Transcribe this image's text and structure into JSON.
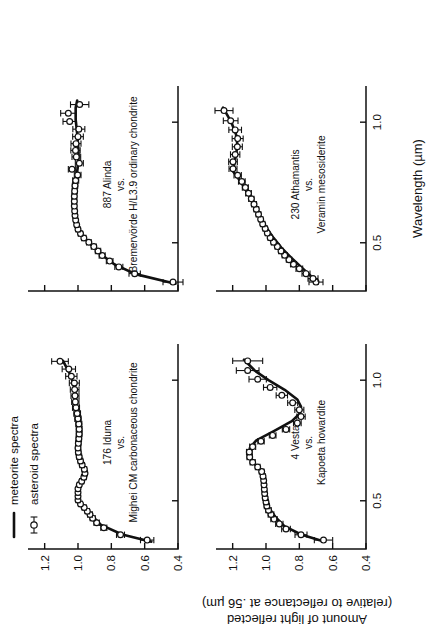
{
  "figure": {
    "axis_titles": {
      "x": "Wavelength (µm)",
      "y_line1": "Amount of light reflected",
      "y_line2": "(relative to reflectance at .56 µm)"
    },
    "legend": {
      "meteorite": "meteorite spectra",
      "asteroid": "asteroid spectra",
      "meteorite_symbol": "solid-line",
      "asteroid_symbol": "open-circle-errorbar"
    },
    "ink_color": "#111111",
    "marker_fill": "#ffffff"
  },
  "chart_data": {
    "type": "scatter",
    "title": "",
    "xlabel": "Wavelength (µm)",
    "ylabel": "Amount of light reflected (relative to reflectance at .56 µm)",
    "xlim": [
      0.3,
      1.15
    ],
    "ylim": [
      0.4,
      1.3
    ],
    "xticks": [
      0.5,
      1.0
    ],
    "xticklabels": [
      "0.5",
      "1.0"
    ],
    "yticks": [
      0.4,
      0.6,
      0.8,
      1.0,
      1.2
    ],
    "yticklabels": [
      "0.4",
      "0.6",
      "0.8",
      "1.0",
      "1.2"
    ],
    "grid": false,
    "legend_position": "top-left",
    "panels": [
      {
        "id": "iduna",
        "position": "top-left",
        "caption_lines": [
          "176 Iduna",
          "vs.",
          "Mighei CM carbonaceous chondrite"
        ],
        "asteroid_series": {
          "name": "asteroid spectra",
          "x": [
            0.337,
            0.359,
            0.388,
            0.409,
            0.428,
            0.443,
            0.457,
            0.472,
            0.487,
            0.503,
            0.519,
            0.534,
            0.55,
            0.566,
            0.581,
            0.598,
            0.614,
            0.631,
            0.648,
            0.665,
            0.683,
            0.701,
            0.719,
            0.738,
            0.757,
            0.777,
            0.797,
            0.818,
            0.84,
            0.862,
            0.886,
            0.91,
            0.935,
            0.961,
            0.988,
            1.016,
            1.046,
            1.078
          ],
          "y": [
            0.585,
            0.745,
            0.845,
            0.888,
            0.912,
            0.928,
            0.944,
            0.963,
            0.985,
            1.0,
            1.0,
            1.0,
            1.0,
            0.992,
            0.978,
            0.965,
            0.958,
            0.962,
            0.975,
            0.985,
            0.993,
            0.998,
            1.0,
            0.998,
            0.995,
            0.993,
            0.993,
            0.995,
            1.0,
            1.005,
            1.012,
            1.016,
            1.018,
            1.02,
            1.022,
            1.04,
            1.055,
            1.108
          ],
          "yerr": [
            0.04,
            0.024,
            0.018,
            0.016,
            0.015,
            0.014,
            0.013,
            0.012,
            0.012,
            0.012,
            0.012,
            0.012,
            0.01,
            0.012,
            0.012,
            0.014,
            0.014,
            0.014,
            0.014,
            0.014,
            0.015,
            0.015,
            0.015,
            0.016,
            0.016,
            0.017,
            0.017,
            0.018,
            0.019,
            0.02,
            0.021,
            0.022,
            0.024,
            0.026,
            0.03,
            0.034,
            0.04,
            0.05
          ]
        },
        "meteorite_series": {
          "name": "meteorite spectra",
          "x": [
            0.33,
            0.36,
            0.4,
            0.44,
            0.48,
            0.51,
            0.54,
            0.57,
            0.6,
            0.63,
            0.66,
            0.7,
            0.74,
            0.79,
            0.84,
            0.9,
            0.96,
            1.02,
            1.08
          ],
          "y": [
            0.56,
            0.735,
            0.862,
            0.92,
            0.975,
            1.0,
            1.002,
            0.99,
            0.968,
            0.96,
            0.975,
            0.992,
            0.998,
            0.993,
            0.998,
            1.008,
            1.018,
            1.044,
            1.09
          ]
        }
      },
      {
        "id": "alinda",
        "position": "top-right",
        "caption_lines": [
          "887 Alinda",
          "vs.",
          "Bremervörde H/L3.9 ordinary chondrite"
        ],
        "asteroid_series": {
          "name": "asteroid spectra",
          "x": [
            0.337,
            0.372,
            0.4,
            0.424,
            0.447,
            0.466,
            0.484,
            0.502,
            0.52,
            0.538,
            0.556,
            0.575,
            0.594,
            0.613,
            0.632,
            0.652,
            0.672,
            0.693,
            0.714,
            0.736,
            0.758,
            0.781,
            0.805,
            0.83,
            0.856,
            0.883,
            0.911,
            0.94,
            0.971,
            1.003,
            1.037,
            1.073
          ],
          "y": [
            0.43,
            0.66,
            0.755,
            0.81,
            0.855,
            0.88,
            0.905,
            0.935,
            0.965,
            0.985,
            1.0,
            1.008,
            1.014,
            1.018,
            1.02,
            1.022,
            1.022,
            1.022,
            1.02,
            1.018,
            1.014,
            1.002,
            1.036,
            0.992,
            1.01,
            1.015,
            1.012,
            1.0,
            0.995,
            1.05,
            1.058,
            0.99
          ],
          "yerr": [
            0.06,
            0.034,
            0.024,
            0.02,
            0.018,
            0.016,
            0.015,
            0.014,
            0.013,
            0.013,
            0.012,
            0.012,
            0.012,
            0.013,
            0.013,
            0.013,
            0.014,
            0.014,
            0.015,
            0.016,
            0.018,
            0.02,
            0.022,
            0.024,
            0.026,
            0.028,
            0.03,
            0.032,
            0.036,
            0.04,
            0.046,
            0.055
          ]
        },
        "meteorite_series": {
          "name": "meteorite spectra",
          "x": [
            0.33,
            0.37,
            0.41,
            0.45,
            0.49,
            0.53,
            0.57,
            0.61,
            0.66,
            0.71,
            0.76,
            0.81,
            0.86,
            0.91,
            0.96,
            1.01,
            1.06,
            1.09
          ],
          "y": [
            0.415,
            0.655,
            0.78,
            0.858,
            0.918,
            0.975,
            1.0,
            1.016,
            1.022,
            1.02,
            1.013,
            1.002,
            0.996,
            1.0,
            1.006,
            1.014,
            1.014,
            1.005
          ]
        }
      },
      {
        "id": "vesta",
        "position": "bottom-left",
        "caption_lines": [
          "4 Vesta",
          "vs.",
          "Kapoeta howardite"
        ],
        "asteroid_series": {
          "name": "asteroid spectra",
          "x": [
            0.337,
            0.359,
            0.383,
            0.404,
            0.424,
            0.443,
            0.461,
            0.478,
            0.495,
            0.512,
            0.53,
            0.548,
            0.566,
            0.584,
            0.602,
            0.621,
            0.64,
            0.66,
            0.681,
            0.702,
            0.724,
            0.747,
            0.771,
            0.796,
            0.822,
            0.849,
            0.877,
            0.906,
            0.937,
            0.97,
            1.004,
            1.04,
            1.08
          ],
          "y": [
            0.655,
            0.79,
            0.88,
            0.92,
            0.952,
            0.97,
            0.985,
            0.995,
            1.0,
            1.005,
            1.008,
            1.01,
            1.012,
            1.014,
            1.018,
            1.026,
            1.05,
            1.08,
            1.098,
            1.1,
            1.08,
            1.03,
            0.96,
            0.88,
            0.812,
            0.79,
            0.8,
            0.84,
            0.905,
            0.975,
            1.05,
            1.11,
            1.11
          ],
          "yerr": [
            0.055,
            0.036,
            0.026,
            0.022,
            0.019,
            0.017,
            0.016,
            0.015,
            0.014,
            0.014,
            0.013,
            0.013,
            0.013,
            0.013,
            0.013,
            0.014,
            0.014,
            0.015,
            0.016,
            0.017,
            0.018,
            0.019,
            0.02,
            0.022,
            0.023,
            0.025,
            0.027,
            0.03,
            0.034,
            0.04,
            0.052,
            0.068,
            0.09
          ]
        },
        "meteorite_series": {
          "name": "meteorite spectra",
          "x": [
            0.33,
            0.36,
            0.395,
            0.43,
            0.47,
            0.51,
            0.55,
            0.59,
            0.625,
            0.66,
            0.69,
            0.72,
            0.75,
            0.79,
            0.83,
            0.86,
            0.89,
            0.92,
            0.96,
            1.0,
            1.04,
            1.085
          ],
          "y": [
            0.648,
            0.79,
            0.89,
            0.94,
            0.982,
            1.004,
            1.012,
            1.016,
            1.03,
            1.078,
            1.098,
            1.096,
            1.058,
            0.95,
            0.845,
            0.8,
            0.79,
            0.812,
            0.888,
            0.985,
            1.068,
            1.132
          ]
        }
      },
      {
        "id": "athamantis",
        "position": "bottom-right",
        "caption_lines": [
          "230 Athamantis",
          "vs.",
          "Veramin mesosiderite"
        ],
        "asteroid_series": {
          "name": "asteroid spectra",
          "x": [
            0.337,
            0.352,
            0.372,
            0.392,
            0.411,
            0.43,
            0.448,
            0.466,
            0.484,
            0.502,
            0.521,
            0.54,
            0.559,
            0.578,
            0.598,
            0.618,
            0.639,
            0.66,
            0.682,
            0.705,
            0.729,
            0.754,
            0.78,
            0.807,
            0.836,
            0.866,
            0.898,
            0.932,
            0.968,
            1.006,
            1.048
          ],
          "y": [
            0.7,
            0.718,
            0.76,
            0.8,
            0.835,
            0.862,
            0.888,
            0.91,
            0.932,
            0.955,
            0.975,
            0.992,
            1.005,
            1.02,
            1.032,
            1.045,
            1.058,
            1.072,
            1.088,
            1.105,
            1.124,
            1.145,
            1.17,
            1.198,
            1.198,
            1.185,
            1.172,
            1.17,
            1.185,
            1.212,
            1.252
          ],
          "yerr": [
            0.042,
            0.03,
            0.024,
            0.02,
            0.018,
            0.016,
            0.015,
            0.014,
            0.013,
            0.013,
            0.012,
            0.012,
            0.012,
            0.013,
            0.013,
            0.014,
            0.014,
            0.015,
            0.016,
            0.017,
            0.018,
            0.02,
            0.022,
            0.024,
            0.026,
            0.028,
            0.03,
            0.033,
            0.038,
            0.044,
            0.054
          ]
        },
        "meteorite_series": {
          "name": "meteorite spectra",
          "x": [
            0.33,
            0.36,
            0.4,
            0.44,
            0.48,
            0.52,
            0.56,
            0.6,
            0.65,
            0.7,
            0.75,
            0.795,
            0.83,
            0.87,
            0.91,
            0.95,
            1.0,
            1.06
          ],
          "y": [
            0.69,
            0.728,
            0.79,
            0.852,
            0.908,
            0.955,
            0.995,
            1.03,
            1.068,
            1.105,
            1.148,
            1.196,
            1.19,
            1.178,
            1.172,
            1.18,
            1.208,
            1.258
          ]
        }
      }
    ]
  }
}
